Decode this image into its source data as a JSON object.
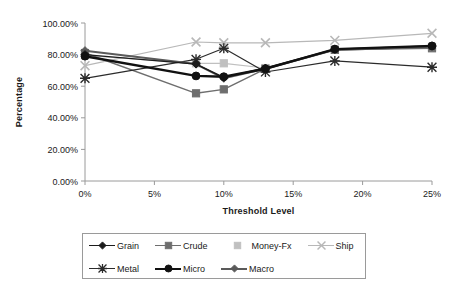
{
  "chart_data": {
    "type": "line",
    "title": "",
    "xlabel": "Threshold Level",
    "ylabel": "Percentage",
    "x": [
      0,
      8,
      10,
      13,
      18,
      25
    ],
    "xtick_labels": [
      "0%",
      "5%",
      "10%",
      "15%",
      "20%",
      "25%"
    ],
    "xtick_values": [
      0,
      5,
      10,
      15,
      20,
      25
    ],
    "ytick_labels": [
      "0.00%",
      "20.00%",
      "40.00%",
      "60.00%",
      "80.00%",
      "100.00%"
    ],
    "ytick_values": [
      0,
      20,
      40,
      60,
      80,
      100
    ],
    "xlim": [
      0,
      25
    ],
    "ylim": [
      0,
      100
    ],
    "grid": false,
    "legend_position": "bottom",
    "series": [
      {
        "name": "Grain",
        "marker": "diamond",
        "color": "#1c1c1c",
        "width": 1.4,
        "values": [
          80.0,
          74.0,
          65.5,
          71.5,
          83.5,
          85.5
        ]
      },
      {
        "name": "Crude",
        "marker": "square",
        "color": "#6e6e6e",
        "width": 1.4,
        "values": [
          81.0,
          55.5,
          58.0,
          71.0,
          83.0,
          84.0
        ]
      },
      {
        "name": "Money-Fx",
        "marker": "light-square",
        "color": "#c0c0c0",
        "width": 1.2,
        "values": [
          79.5,
          74.5,
          74.5,
          71.5,
          83.0,
          85.0
        ]
      },
      {
        "name": "Ship",
        "marker": "x",
        "color": "#b8b8b8",
        "width": 1.2,
        "values": [
          73.0,
          88.0,
          87.5,
          87.5,
          89.0,
          93.5
        ]
      },
      {
        "name": "Metal",
        "marker": "asterisk",
        "color": "#2b2b2b",
        "width": 1.2,
        "values": [
          65.0,
          77.0,
          84.0,
          69.0,
          76.0,
          72.0
        ]
      },
      {
        "name": "Micro",
        "marker": "circle",
        "color": "#111111",
        "width": 2.4,
        "values": [
          79.0,
          66.5,
          66.0,
          71.0,
          83.5,
          85.5
        ]
      },
      {
        "name": "Macro",
        "marker": "diamond",
        "color": "#5a5a5a",
        "width": 2.0,
        "values": [
          82.5,
          74.0,
          65.0,
          71.0,
          83.0,
          85.0
        ]
      }
    ]
  },
  "legend": {
    "rows": [
      [
        "Grain",
        "Crude",
        "Money-Fx",
        "Ship"
      ],
      [
        "Metal",
        "Micro",
        "Macro"
      ]
    ]
  }
}
